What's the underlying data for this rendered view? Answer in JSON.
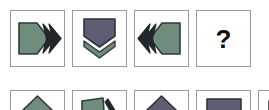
{
  "puzzle": {
    "type": "matrix-reasoning-analogy",
    "question_mark": "?",
    "palette": {
      "green": "#6f8c7d",
      "green_stroke": "#2f3b36",
      "purple": "#5d5d73",
      "purple_stroke": "#32323f",
      "dark": "#23272b",
      "cell_border": "#9a9a9a",
      "background": "#ffffff"
    },
    "question_row": {
      "label": "question-row",
      "cells": [
        {
          "name": "cell-1",
          "description": "green shield pointing right with dark double-chevron pointing right",
          "shield_color": "green",
          "chevron_color": "dark",
          "direction": "right",
          "chevron_count": 2
        },
        {
          "name": "cell-2",
          "description": "purple shield pointing down with green single chevron pointing down",
          "shield_color": "purple",
          "chevron_color": "green",
          "direction": "down",
          "chevron_count": 1
        },
        {
          "name": "cell-3",
          "description": "green shield pointing left with dark double-chevron pointing left",
          "shield_color": "green",
          "chevron_color": "dark",
          "direction": "left",
          "chevron_count": 2
        },
        {
          "name": "cell-4-answer",
          "description": "unknown answer cell showing a question mark",
          "shield_color": "none",
          "chevron_color": "none",
          "direction": "none",
          "chevron_count": 0
        }
      ]
    },
    "options_row": {
      "label": "options-row-partially-visible",
      "cells": [
        {
          "name": "option-a",
          "description": "green pentagon pointing up, cropped at bottom of image",
          "shape_color": "green"
        },
        {
          "name": "option-b",
          "description": "green quadrilateral with dark chevron to its right, cropped",
          "shape_color": "green"
        },
        {
          "name": "option-c",
          "description": "purple pentagon pointing up, cropped",
          "shape_color": "purple"
        },
        {
          "name": "option-d",
          "description": "purple rectangle block, cropped",
          "shape_color": "purple"
        },
        {
          "name": "option-e",
          "description": "partially visible shape at right edge, mostly cropped",
          "shape_color": "purple"
        }
      ]
    }
  }
}
